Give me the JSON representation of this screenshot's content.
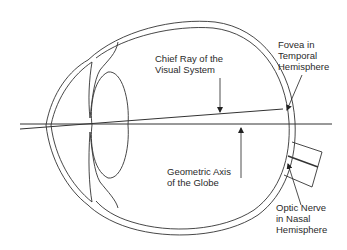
{
  "figure": {
    "labels": {
      "chief_ray": {
        "line1": "Chief Ray of the",
        "line2": "Visual System"
      },
      "fovea": {
        "line1": "Fovea in",
        "line2": "Temporal",
        "line3": "Hemisphere"
      },
      "geometric_axis": {
        "line1": "Geometric Axis",
        "line2": "of the Globe"
      },
      "optic_nerve": {
        "line1": "Optic Nerve",
        "line2": "in Nasal",
        "line3": "Hemisphere"
      }
    },
    "colors": {
      "stroke": "#333333",
      "text": "#2a2a2a",
      "background": "#ffffff"
    }
  }
}
